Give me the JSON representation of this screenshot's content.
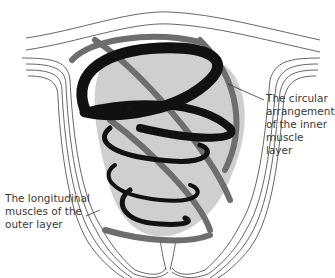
{
  "diagram": {
    "labels": {
      "inner_layer": "The circular\narrangement\nof the inner\nmuscle layer",
      "outer_layer": "The longitudinal\nmuscles of the\nouter layer"
    },
    "colors": {
      "background": "#ffffff",
      "outline": "#555555",
      "body_fill": "#cfcfcf",
      "inner_spiral": "#111111",
      "outer_spiral": "#6e6e6e",
      "label_text": "#3a3a3a",
      "leader_line": "#333333"
    }
  }
}
